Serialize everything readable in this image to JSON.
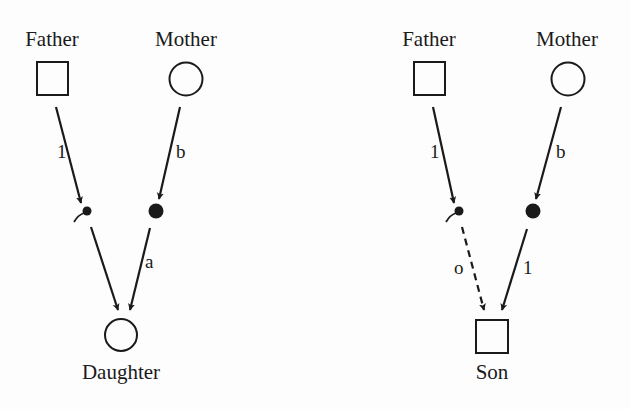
{
  "diagrams": [
    {
      "id": "daughter",
      "father_label": "Father",
      "mother_label": "Mother",
      "father_edge_label": "1",
      "mother_edge_label": "b",
      "sperm_to_child_label": "",
      "egg_to_child_label": "a",
      "child_label": "Daughter",
      "child_shape": "circle",
      "sperm_to_child_style": "solid"
    },
    {
      "id": "son",
      "father_label": "Father",
      "mother_label": "Mother",
      "father_edge_label": "1",
      "mother_edge_label": "b",
      "sperm_to_child_label": "o",
      "egg_to_child_label": "1",
      "child_label": "Son",
      "child_shape": "square",
      "sperm_to_child_style": "dashed"
    }
  ],
  "colors": {
    "ink": "#1a1a1a",
    "background": "#fdfdfd"
  }
}
